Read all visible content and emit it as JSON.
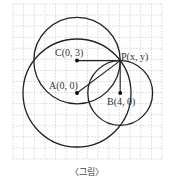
{
  "figure": {
    "caption": "〈그림〉",
    "grid": {
      "x0": 13,
      "y0": 4,
      "x1": 162,
      "y1": 159,
      "cols": 14,
      "rows": 14,
      "color": "#bdbdbd"
    },
    "scale_px_per_unit": 10.8,
    "origin_px": [
      77,
      93
    ],
    "points": [
      {
        "id": "A",
        "label": "A(0, 0)",
        "x": 0,
        "y": 0
      },
      {
        "id": "B",
        "label": "B(4, 0)",
        "x": 4,
        "y": 0
      },
      {
        "id": "C",
        "label": "C(0, 3)",
        "x": 0,
        "y": 3
      },
      {
        "id": "P",
        "label": "P(x, y)",
        "x": 4,
        "y": 3
      }
    ],
    "circles": [
      {
        "center": "C",
        "radius": 4
      },
      {
        "center": "A",
        "radius": 5
      },
      {
        "center": "B",
        "radius": 3
      }
    ],
    "segments": [
      [
        "C",
        "P"
      ],
      [
        "A",
        "P"
      ],
      [
        "B",
        "P"
      ]
    ],
    "stroke_color": "#222222"
  }
}
